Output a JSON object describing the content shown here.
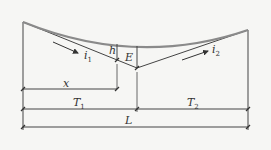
{
  "diagram": {
    "type": "vertical curve (sag) geometry",
    "labels": {
      "i1": "i",
      "i1_sub": "1",
      "i2": "i",
      "i2_sub": "2",
      "h": "h",
      "E": "E",
      "x": "x",
      "T1": "T",
      "T1_sub": "1",
      "T2": "T",
      "T2_sub": "2",
      "L": "L"
    },
    "colors": {
      "curve": "#8a8a8a",
      "lines": "#444444",
      "background": "#f6f6f4"
    }
  }
}
